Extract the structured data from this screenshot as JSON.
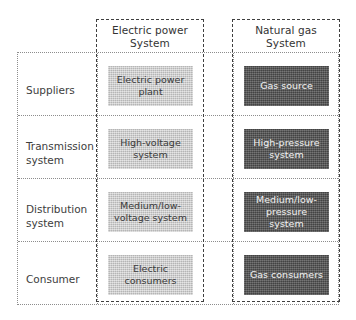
{
  "diagram": {
    "colors": {
      "electric_box_fill": "#c9c9c9",
      "electric_box_text": "#3a3a3a",
      "gas_box_fill": "#595959",
      "gas_box_text": "#f2f2f2",
      "grid_line": "#8d8d8d",
      "group_border": "#3f3f3f",
      "background": "#ffffff"
    }
  },
  "columns": [
    {
      "id": "electric",
      "header_line1": "Electric power",
      "header_line2": "System"
    },
    {
      "id": "gas",
      "header_line1": "Natural gas",
      "header_line2": "System"
    }
  ],
  "rows": [
    {
      "label_line1": "Suppliers",
      "label_line2": "",
      "electric": "Electric power plant",
      "gas": "Gas source"
    },
    {
      "label_line1": "Transmission",
      "label_line2": "system",
      "electric": "High-voltage system",
      "gas": "High-pressure system"
    },
    {
      "label_line1": "Distribution",
      "label_line2": "system",
      "electric": "Medium/low-voltage system",
      "gas": "Medium/low-pressure system"
    },
    {
      "label_line1": "Consumer",
      "label_line2": "",
      "electric": "Electric consumers",
      "gas": "Gas consumers"
    }
  ]
}
